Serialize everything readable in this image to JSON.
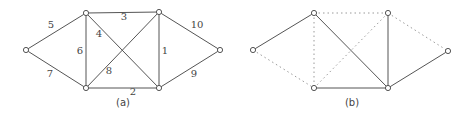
{
  "figures": [
    {
      "id": "a",
      "caption": "(a)",
      "caption_pos": [
        123,
        103
      ],
      "nodes": [
        {
          "id": "L",
          "x": 26,
          "y": 50
        },
        {
          "id": "TL",
          "x": 86,
          "y": 13
        },
        {
          "id": "TR",
          "x": 159,
          "y": 12
        },
        {
          "id": "R",
          "x": 220,
          "y": 50
        },
        {
          "id": "BL",
          "x": 86,
          "y": 88
        },
        {
          "id": "BR",
          "x": 159,
          "y": 88
        }
      ],
      "edges": [
        {
          "from": "TR",
          "to": "BR",
          "weight": "1",
          "style": "solid",
          "label_pos": [
            165,
            51
          ]
        },
        {
          "from": "BL",
          "to": "BR",
          "weight": "2",
          "style": "solid",
          "label_pos": [
            133,
            92
          ]
        },
        {
          "from": "TL",
          "to": "TR",
          "weight": "3",
          "style": "solid",
          "label_pos": [
            124,
            17
          ]
        },
        {
          "from": "TL",
          "to": "BR",
          "weight": "4",
          "style": "solid",
          "label_pos": [
            99,
            34
          ]
        },
        {
          "from": "L",
          "to": "TL",
          "weight": "5",
          "style": "solid",
          "label_pos": [
            51,
            25
          ]
        },
        {
          "from": "TL",
          "to": "BL",
          "weight": "6",
          "style": "solid",
          "label_pos": [
            80,
            51
          ]
        },
        {
          "from": "L",
          "to": "BL",
          "weight": "7",
          "style": "solid",
          "label_pos": [
            50,
            74
          ]
        },
        {
          "from": "BL",
          "to": "TR",
          "weight": "8",
          "style": "solid",
          "label_pos": [
            109,
            71
          ]
        },
        {
          "from": "BR",
          "to": "R",
          "weight": "9",
          "style": "solid",
          "label_pos": [
            194,
            74
          ]
        },
        {
          "from": "TR",
          "to": "R",
          "weight": "10",
          "style": "solid",
          "label_pos": [
            197,
            25
          ]
        }
      ]
    },
    {
      "id": "b",
      "caption": "(b)",
      "caption_pos": [
        352,
        103
      ],
      "nodes": [
        {
          "id": "L",
          "x": 253,
          "y": 50
        },
        {
          "id": "TL",
          "x": 314,
          "y": 13
        },
        {
          "id": "TR",
          "x": 388,
          "y": 13
        },
        {
          "id": "R",
          "x": 448,
          "y": 51
        },
        {
          "id": "BL",
          "x": 314,
          "y": 88
        },
        {
          "id": "BR",
          "x": 388,
          "y": 88
        }
      ],
      "edges": [
        {
          "from": "L",
          "to": "TL",
          "style": "solid"
        },
        {
          "from": "TL",
          "to": "BR",
          "style": "solid"
        },
        {
          "from": "TR",
          "to": "BR",
          "style": "solid"
        },
        {
          "from": "BL",
          "to": "BR",
          "style": "solid"
        },
        {
          "from": "BR",
          "to": "R",
          "style": "solid"
        },
        {
          "from": "TL",
          "to": "TR",
          "style": "dotted"
        },
        {
          "from": "TL",
          "to": "BL",
          "style": "dotted"
        },
        {
          "from": "L",
          "to": "BL",
          "style": "dotted"
        },
        {
          "from": "BL",
          "to": "TR",
          "style": "dotted"
        },
        {
          "from": "TR",
          "to": "R",
          "style": "dotted"
        }
      ]
    }
  ],
  "colors": {
    "edge": "#555555",
    "dotted_edge": "#9a9a9a",
    "label": "#444444",
    "background": "#ffffff"
  }
}
